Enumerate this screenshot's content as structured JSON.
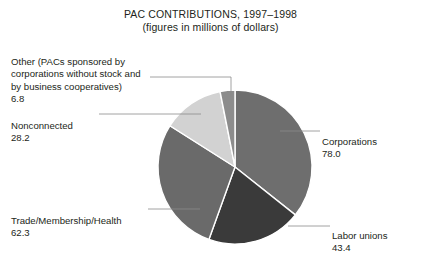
{
  "chart_data": {
    "type": "pie",
    "title": "PAC CONTRIBUTIONS, 1997–1998",
    "subtitle": "(figures in millions of dollars)",
    "units": "millions of dollars",
    "total": 218.7,
    "categories": [
      "Corporations",
      "Labor unions",
      "Trade/Membership/Health",
      "Nonconnected",
      "Other (PACs sponsored by corporations without stock and by business cooperatives)"
    ],
    "values": [
      78.0,
      43.4,
      62.3,
      28.2,
      6.8
    ],
    "slices": [
      {
        "key": "corporations",
        "label": "Corporations",
        "value": "78.0",
        "numeric": 78.0,
        "color": "#6e6e6e",
        "start_angle": 0.0,
        "end_angle": 128.4,
        "label_side": "right"
      },
      {
        "key": "labor-unions",
        "label": "Labor unions",
        "value": "43.4",
        "numeric": 43.4,
        "color": "#3a3a3a",
        "start_angle": 128.4,
        "end_angle": 199.8,
        "label_side": "right"
      },
      {
        "key": "trade-membership-health",
        "label": "Trade/Membership/Health",
        "value": "62.3",
        "numeric": 62.3,
        "color": "#6a6a6a",
        "start_angle": 199.8,
        "end_angle": 302.4,
        "label_side": "left"
      },
      {
        "key": "nonconnected",
        "label": "Nonconnected",
        "value": "28.2",
        "numeric": 28.2,
        "color": "#d2d2d2",
        "start_angle": 302.4,
        "end_angle": 348.8,
        "label_side": "left"
      },
      {
        "key": "other",
        "label": "Other (PACs sponsored by\ncorporations without stock and\nby business cooperatives)",
        "value": "6.8",
        "numeric": 6.8,
        "color": "#8c8c8c",
        "start_angle": 348.8,
        "end_angle": 360.0,
        "label_side": "left"
      }
    ],
    "legend_position": "callout-labels",
    "grid": false,
    "background_color": "#ffffff",
    "text_color": "#231f20",
    "slice_border_color": "#ffffff"
  }
}
